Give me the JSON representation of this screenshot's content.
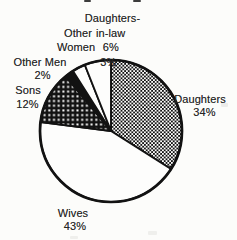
{
  "colors": {
    "ink": "#121212",
    "paper": "#fcfcfa",
    "text": "#262626",
    "white_fill": "#fdfdfc"
  },
  "chart_data": {
    "type": "pie",
    "title": "",
    "direction": "clockwise",
    "start_angle_deg": 0,
    "legend_position": "none",
    "geometry_note": "slice text labels placed around pie, multi-line",
    "slices": [
      {
        "label": "Daughters",
        "value": 34,
        "percent_text": "34%",
        "fill": "checkerboard"
      },
      {
        "label": "Wives",
        "value": 43,
        "percent_text": "43%",
        "fill": "white"
      },
      {
        "label": "Sons",
        "value": 12,
        "percent_text": "12%",
        "fill": "dot-grid"
      },
      {
        "label": "Other Men",
        "value": 2,
        "percent_text": "2%",
        "fill": "solid-black"
      },
      {
        "label": "Other Women",
        "value": 3,
        "percent_text": "3%",
        "fill": "white"
      },
      {
        "label": "Daughters-in-law",
        "value": 6,
        "percent_text": "6%",
        "fill": "white"
      }
    ],
    "labels": [
      {
        "name": "daughters-label",
        "lines": [
          {
            "t": "Daughters",
            "x": 200,
            "y": 98.5
          },
          {
            "t": "34%",
            "x": 204.5,
            "y": 112
          }
        ]
      },
      {
        "name": "wives-label",
        "lines": [
          {
            "t": "Wives",
            "x": 73,
            "y": 212.5
          },
          {
            "t": "43%",
            "x": 75,
            "y": 226
          }
        ]
      },
      {
        "name": "sons-label",
        "lines": [
          {
            "t": "Sons",
            "x": 28,
            "y": 90
          },
          {
            "t": "12%",
            "x": 27.5,
            "y": 104
          }
        ]
      },
      {
        "name": "other-men-label",
        "lines": [
          {
            "t": "Other Men",
            "x": 40,
            "y": 62
          },
          {
            "t": "2%",
            "x": 42.5,
            "y": 75
          }
        ]
      },
      {
        "name": "other-women-label",
        "lines": [
          {
            "t": "Other",
            "x": 78,
            "y": 33.3
          },
          {
            "t": "Women",
            "x": 76,
            "y": 47
          },
          {
            "t": "3%",
            "x": 108.3,
            "y": 61.7
          }
        ]
      },
      {
        "name": "daughters-in-law-label",
        "lines": [
          {
            "t": "Daughters-",
            "x": 112.5,
            "y": 18
          },
          {
            "t": "in-law",
            "x": 110.7,
            "y": 33.3
          },
          {
            "t": "6%",
            "x": 110.8,
            "y": 46.7
          }
        ]
      }
    ]
  },
  "artifacts": [
    {
      "name": "cropped-text-fragment",
      "x": 84,
      "y": 0,
      "w": 7,
      "h": 2,
      "color": "#3c3c3c"
    },
    {
      "name": "cropped-text-fragment",
      "x": 133,
      "y": 0,
      "w": 8,
      "h": 2,
      "color": "#3c3c3c"
    },
    {
      "name": "scan-speck",
      "x": 221,
      "y": 103,
      "w": 7,
      "h": 4,
      "color": "#ececea"
    },
    {
      "name": "scan-speck",
      "x": 148,
      "y": 231,
      "w": 9,
      "h": 4,
      "color": "#efefec"
    },
    {
      "name": "scan-speck",
      "x": 70,
      "y": 236,
      "w": 8,
      "h": 3,
      "color": "#efefec"
    }
  ]
}
